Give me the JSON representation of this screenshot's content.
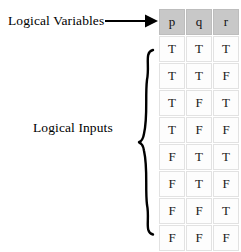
{
  "figure": {
    "type": "truth-table-diagram"
  },
  "annotations": {
    "variables_label": "Logical Variables",
    "inputs_label": "Logical Inputs",
    "arrow": "right-arrow-icon",
    "brace": "left-curly-brace-icon"
  },
  "table": {
    "headers": [
      "p",
      "q",
      "r"
    ],
    "rows": [
      [
        "T",
        "T",
        "T"
      ],
      [
        "T",
        "T",
        "F"
      ],
      [
        "T",
        "F",
        "T"
      ],
      [
        "T",
        "F",
        "F"
      ],
      [
        "F",
        "T",
        "T"
      ],
      [
        "F",
        "T",
        "F"
      ],
      [
        "F",
        "F",
        "T"
      ],
      [
        "F",
        "F",
        "F"
      ]
    ]
  },
  "colors": {
    "header_background": "#c8c8c8",
    "cell_background": "#fdfdfd",
    "cell_border": "#e2e2e2",
    "text": "#000000",
    "page_background": "#ffffff"
  }
}
